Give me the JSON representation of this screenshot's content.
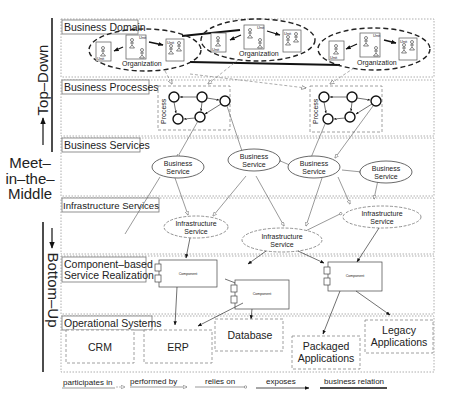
{
  "side_labels": {
    "top_down": "Top–Down",
    "meet_line1": "Meet–",
    "meet_line2": "in–the–",
    "meet_line3": "Middle",
    "bottom_up": "Bottom–Up"
  },
  "layers": [
    {
      "id": "business-domain",
      "title": "Business Domain"
    },
    {
      "id": "business-processes",
      "title": "Business Processes"
    },
    {
      "id": "business-services",
      "title": "Business Services"
    },
    {
      "id": "infrastructure-services",
      "title": "Infrastructure Services"
    },
    {
      "id": "component-realization",
      "title_line1": "Component–based",
      "title_line2": "Service Realization"
    },
    {
      "id": "operational-systems",
      "title": "Operational Systems"
    }
  ],
  "organizations": [
    {
      "label": "Organization",
      "unit_label": "Unit"
    },
    {
      "label": "Organization",
      "unit_label": "Unit"
    },
    {
      "label": "Organization",
      "unit_label": "Unit"
    }
  ],
  "processes": [
    {
      "label": "Process"
    },
    {
      "label": "Process"
    }
  ],
  "business_services": [
    {
      "line1": "Business",
      "line2": "Service"
    },
    {
      "line1": "Business",
      "line2": "Service"
    },
    {
      "line1": "Business",
      "line2": "Service"
    },
    {
      "line1": "Business",
      "line2": "Service"
    },
    {
      "line1": "Business",
      "line2": "Service"
    }
  ],
  "infrastructure_services": [
    {
      "line1": "Infrastructure",
      "line2": "Service"
    },
    {
      "line1": "Infrastructure",
      "line2": "Service"
    },
    {
      "line1": "Infrastructure",
      "line2": "Service"
    }
  ],
  "components": [
    {
      "label": "Component"
    },
    {
      "label": "Component"
    },
    {
      "label": "Component"
    }
  ],
  "operational_systems": [
    {
      "label": "CRM"
    },
    {
      "label": "ERP"
    },
    {
      "label": "Database"
    },
    {
      "line1": "Packaged",
      "line2": "Applications"
    },
    {
      "line1": "Legacy",
      "line2": "Applications"
    }
  ],
  "legend": [
    {
      "label": "participates in",
      "style": "dashed-open-triangle"
    },
    {
      "label": "performed by",
      "style": "solid-open-triangle"
    },
    {
      "label": "relies on",
      "style": "solid-open-circle"
    },
    {
      "label": "exposes",
      "style": "solid-filled-arrow"
    },
    {
      "label": "business relation",
      "style": "thick-line"
    }
  ],
  "colors": {
    "line": "#333333",
    "layer_border": "#999999",
    "background": "#ffffff"
  }
}
